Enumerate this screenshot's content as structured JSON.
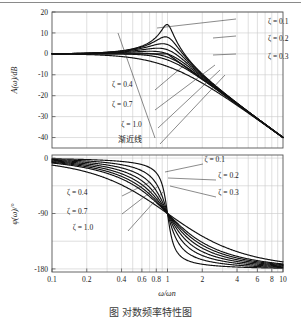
{
  "figure": {
    "caption": "图        对数频率特性图"
  },
  "chart_data": [
    {
      "id": "magnitude",
      "type": "line",
      "title": "",
      "xlabel": "ω/ωn",
      "ylabel": "A(ω)/dB",
      "xscale": "log",
      "xlim": [
        0.1,
        10
      ],
      "ylim": [
        -45,
        20
      ],
      "grid": true,
      "legend_position": "inline-annotations",
      "xticks": [
        0.1,
        0.2,
        0.4,
        0.6,
        0.8,
        1,
        2,
        4,
        6,
        8,
        10
      ],
      "xticklabels": [
        "0.1",
        "0.2",
        "0.4",
        "0.6",
        "0.8",
        "1",
        "2",
        "4",
        "6",
        "8",
        "10"
      ],
      "yticks": [
        20,
        10,
        0,
        -10,
        -20,
        -30,
        -40
      ],
      "yticklabels": [
        "20",
        "10",
        "0",
        "-10",
        "-20",
        "-30",
        "-40"
      ],
      "series": [
        {
          "name": "ζ = 0.1",
          "zeta": 0.1,
          "peak_db": 14.0,
          "peak_x": 0.99
        },
        {
          "name": "ζ = 0.2",
          "zeta": 0.2,
          "peak_db": 8.1,
          "peak_x": 0.96
        },
        {
          "name": "ζ = 0.3",
          "zeta": 0.3,
          "peak_db": 4.8,
          "peak_x": 0.91
        },
        {
          "name": "ζ = 0.4",
          "zeta": 0.4,
          "peak_db": 2.7,
          "peak_x": 0.82
        },
        {
          "name": "ζ = 0.5",
          "zeta": 0.5,
          "peak_db": 1.2,
          "peak_x": 0.71
        },
        {
          "name": "ζ = 0.6",
          "zeta": 0.6,
          "peak_db": 0.3,
          "peak_x": 0.53
        },
        {
          "name": "ζ = 0.7",
          "zeta": 0.7,
          "peak_db": 0.0,
          "peak_x": 0.14
        },
        {
          "name": "ζ = 1.0",
          "zeta": 1.0,
          "peak_db": 0.0,
          "peak_x": 0.1
        }
      ],
      "asymptote": {
        "label": "渐近线",
        "segments": [
          [
            0.1,
            0
          ],
          [
            1,
            0
          ],
          [
            10,
            -40
          ]
        ]
      },
      "annotations": [
        {
          "label": "ζ = 0.1",
          "x": 0.935,
          "y": 0.085
        },
        {
          "label": "ζ = 0.2",
          "x": 0.935,
          "y": 0.215
        },
        {
          "label": "ζ = 0.3",
          "x": 0.935,
          "y": 0.345
        },
        {
          "label": "ζ = 0.4",
          "x": 0.26,
          "y": 0.55
        },
        {
          "label": "ζ = 0.7",
          "x": 0.26,
          "y": 0.7
        },
        {
          "label": "ζ = 1.0",
          "x": 0.3,
          "y": 0.845
        },
        {
          "label": "渐近线",
          "x": 0.285,
          "y": 0.955
        }
      ]
    },
    {
      "id": "phase",
      "type": "line",
      "title": "",
      "xlabel": "ω/ωn",
      "ylabel": "φ(ω)/°",
      "xscale": "log",
      "xlim": [
        0.1,
        10
      ],
      "ylim": [
        -185,
        5
      ],
      "grid": true,
      "legend_position": "inline-annotations",
      "xticks": [
        0.1,
        0.2,
        0.4,
        0.6,
        0.8,
        1,
        2,
        4,
        6,
        8,
        10
      ],
      "xticklabels": [
        "0.1",
        "0.2",
        "0.4",
        "0.6",
        "0.8",
        "1",
        "2",
        "4",
        "6",
        "8",
        "10"
      ],
      "yticks": [
        0,
        -90,
        -180
      ],
      "yticklabels": [
        "0",
        "-90",
        "-180"
      ],
      "series": [
        {
          "name": "ζ = 0.1",
          "zeta": 0.1
        },
        {
          "name": "ζ = 0.2",
          "zeta": 0.2
        },
        {
          "name": "ζ = 0.3",
          "zeta": 0.3
        },
        {
          "name": "ζ = 0.4",
          "zeta": 0.4
        },
        {
          "name": "ζ = 0.5",
          "zeta": 0.5
        },
        {
          "name": "ζ = 0.6",
          "zeta": 0.6
        },
        {
          "name": "ζ = 0.7",
          "zeta": 0.7
        },
        {
          "name": "ζ = 1.0",
          "zeta": 1.0
        }
      ],
      "annotations": [
        {
          "label": "ζ = 0.1",
          "x": 0.66,
          "y": 0.06
        },
        {
          "label": "ζ = 0.2",
          "x": 0.72,
          "y": 0.2
        },
        {
          "label": "ζ = 0.3",
          "x": 0.72,
          "y": 0.345
        },
        {
          "label": "ζ = 0.4",
          "x": 0.065,
          "y": 0.345
        },
        {
          "label": "ζ = 0.7",
          "x": 0.065,
          "y": 0.5
        },
        {
          "label": "ζ = 1.0",
          "x": 0.09,
          "y": 0.645
        }
      ]
    }
  ],
  "colors": {
    "curve": "#111111",
    "grid": "#c9c9c9",
    "frame": "#555555",
    "text": "#1a1a1a"
  }
}
